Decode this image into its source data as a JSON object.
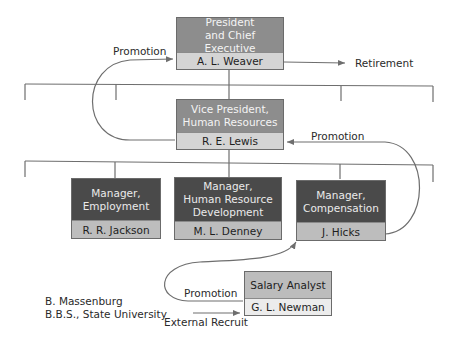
{
  "diagram": {
    "type": "org-chart-career-paths",
    "boxes": {
      "president": {
        "title_line1": "President",
        "title_line2": "and Chief Executive",
        "name": "A. L. Weaver"
      },
      "vp_hr": {
        "title_line1": "Vice President,",
        "title_line2": "Human Resources",
        "name": "R. E. Lewis"
      },
      "mgr_employment": {
        "title_line1": "Manager,",
        "title_line2": "Employment",
        "name": "R. R. Jackson"
      },
      "mgr_hrd": {
        "title_line1": "Manager,",
        "title_line2": "Human Resource",
        "title_line3": "Development",
        "name": "M. L. Denney"
      },
      "mgr_comp": {
        "title_line1": "Manager,",
        "title_line2": "Compensation",
        "name": "J. Hicks"
      },
      "salary_analyst": {
        "title": "Salary Analyst",
        "name": "G. L. Newman"
      }
    },
    "labels": {
      "promotion_top": "Promotion",
      "retirement": "Retirement",
      "promotion_mid": "Promotion",
      "promotion_bottom": "Promotion",
      "external_recruit": "External Recruit",
      "candidate_name": "B. Massenburg",
      "candidate_degree": "B.B.S., State University"
    },
    "colors": {
      "line": "#6e6e6e",
      "top_title_fill": "#8d8d8d",
      "manager_title_fill": "#4a4a4a",
      "analyst_title_fill": "#bcbcbc"
    }
  }
}
